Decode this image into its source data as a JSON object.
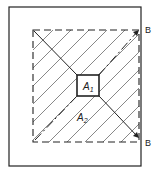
{
  "diagram": {
    "labels": {
      "inner_area": "A",
      "inner_sub": "1",
      "outer_area": "A",
      "outer_sub": "2",
      "section_top": "B",
      "section_bottom": "B"
    },
    "colors": {
      "stroke": "#222222",
      "hatch": "#444444",
      "background": "#ffffff"
    }
  }
}
